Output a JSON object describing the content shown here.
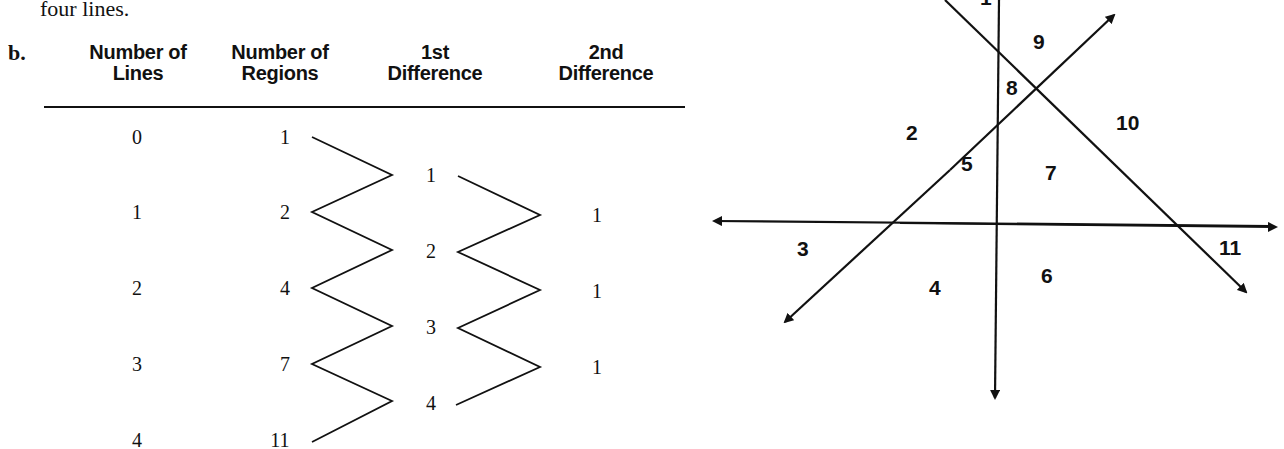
{
  "intro_text": "four lines.",
  "part_label": "b.",
  "table": {
    "headers": [
      {
        "line1": "Number of",
        "line2": "Lines"
      },
      {
        "line1": "Number of",
        "line2": "Regions"
      },
      {
        "line1": "1st",
        "line2": "Difference"
      },
      {
        "line1": "2nd",
        "line2": "Difference"
      }
    ],
    "lines": [
      "0",
      "1",
      "2",
      "3",
      "4"
    ],
    "regions": [
      "1",
      "2",
      "4",
      "7",
      "11"
    ],
    "first_difference": [
      "1",
      "2",
      "3",
      "4"
    ],
    "second_difference": [
      "1",
      "1",
      "1"
    ]
  },
  "diagram": {
    "region_labels": [
      "1",
      "2",
      "3",
      "4",
      "5",
      "6",
      "7",
      "8",
      "9",
      "10",
      "11"
    ],
    "line_count": 4
  }
}
